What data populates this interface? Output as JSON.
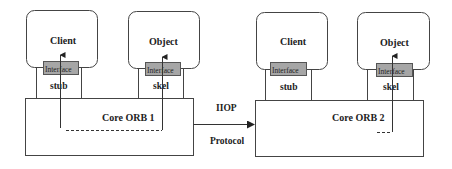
{
  "diagram": {
    "colors": {
      "stroke": "#444444",
      "interface_fill": "#a6a6a6",
      "background": "#ffffff",
      "text": "#222222"
    },
    "left_orb": {
      "client_label": "Client",
      "object_label": "Object",
      "client_interface_label": "Interface",
      "object_interface_label": "Interface",
      "stub_label": "stub",
      "skel_label": "skel",
      "core_label": "Core ORB 1"
    },
    "right_orb": {
      "client_label": "Client",
      "object_label": "Object",
      "client_interface_label": "Interface",
      "object_interface_label": "Interface",
      "stub_label": "stub",
      "skel_label": "skel",
      "core_label": "Core ORB 2"
    },
    "connector": {
      "top_label": "IIOP",
      "bottom_label": "Protocol"
    }
  }
}
